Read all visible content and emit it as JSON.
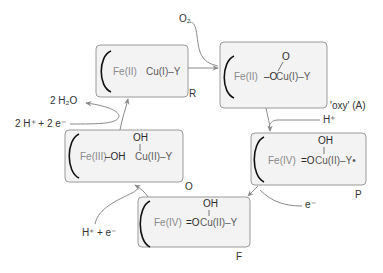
{
  "states": {
    "R": {
      "label": "R",
      "fe": "Fe(II)",
      "cu": "Cu(I)–Y"
    },
    "A": {
      "label": "'oxy' (A)",
      "fe": "Fe(II)",
      "fe_ligand": "–O",
      "top_o": "O",
      "cu": "Cu(I)–Y"
    },
    "P": {
      "label": "P",
      "fe": "Fe(IV)",
      "fe_ligand": "=O",
      "cu_oh": "OH",
      "cu": "Cu(II)–Y•"
    },
    "F": {
      "label": "F",
      "fe": "Fe(IV)",
      "fe_ligand": "=O",
      "cu_oh": "OH",
      "cu": "Cu(II)–Y"
    },
    "O": {
      "label": "O",
      "fe": "Fe(III)",
      "fe_ligand": "–OH",
      "cu_oh": "OH",
      "cu": "Cu(II)–Y"
    }
  },
  "inputs": {
    "o2": "O₂",
    "h_plus": "H⁺",
    "e_minus": "e⁻",
    "h_plus_e": "H⁺ + e⁻",
    "two_h_two_e": "2 H⁺ + 2 e⁻",
    "two_h2o": "2 H₂O"
  },
  "colors": {
    "box_fill": "#f3f3f3",
    "box_stroke": "#9a9a9a",
    "arrow": "#8a8a8a",
    "fe_text": "#8a8a8a",
    "ring": "#111111"
  }
}
